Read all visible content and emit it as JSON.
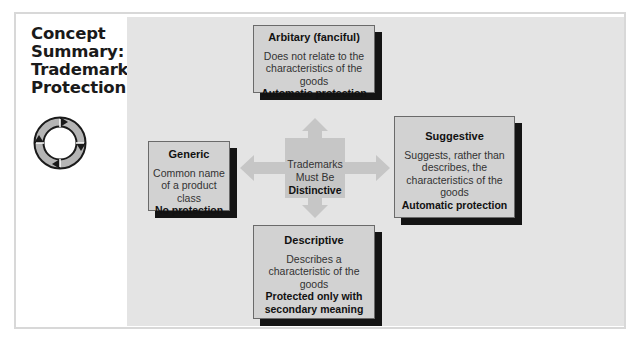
{
  "sidebar": {
    "title_lines": [
      "Concept",
      "Summary:",
      "Trademark",
      "Protection"
    ],
    "icon": "cycle-arrows-icon"
  },
  "center": {
    "line1": "Trademarks",
    "line2": "Must Be",
    "line3": "Distinctive"
  },
  "boxes": {
    "arbitrary": {
      "title": "Arbitary (fanciful)",
      "description": "Does not relate to the characteristics of the goods",
      "protection": "Automatic protection"
    },
    "generic": {
      "title": "Generic",
      "description": "Common name of a product class",
      "protection": "No protection"
    },
    "suggestive": {
      "title": "Suggestive",
      "description": "Suggests, rather than describes, the characteristics of the goods",
      "protection": "Automatic protection"
    },
    "descriptive": {
      "title": "Descriptive",
      "description": "Describes a characteristic of the goods",
      "protection": "Protected only with secondary meaning"
    }
  },
  "colors": {
    "panel": "#e4e4e4",
    "box": "#d2d2d2",
    "shadow": "#141414",
    "arrow": "#c6c6c6"
  }
}
